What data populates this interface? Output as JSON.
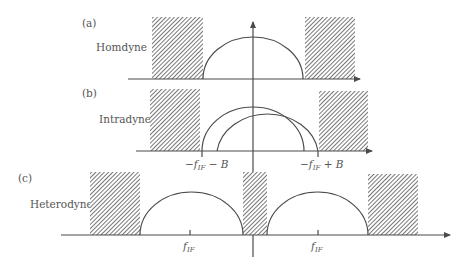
{
  "figure": {
    "panels": [
      {
        "id": "a",
        "tag": "(a)",
        "name": "Homdyne",
        "tick_labels": []
      },
      {
        "id": "b",
        "tag": "(b)",
        "name": "Intradyne",
        "tick_labels": [
          {
            "prefix": "−f",
            "sub": "IF",
            "suffix": " − B"
          },
          {
            "prefix": "−f",
            "sub": "IF",
            "suffix": " + B"
          }
        ]
      },
      {
        "id": "c",
        "tag": "(c)",
        "name": "Heterodyne",
        "tick_labels": [
          {
            "prefix": "f",
            "sub": "IF",
            "suffix": ""
          },
          {
            "prefix": "f",
            "sub": "IF",
            "suffix": ""
          }
        ]
      }
    ],
    "colors": {
      "line": "#4a4a4a",
      "hatch": "#555555",
      "text": "#555555",
      "background": "#ffffff"
    }
  }
}
